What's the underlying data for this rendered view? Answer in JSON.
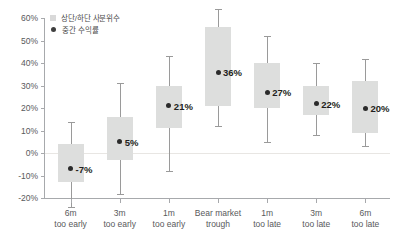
{
  "chart_data": {
    "type": "box",
    "title": "",
    "xlabel": "",
    "ylabel": "",
    "ylim": [
      -20,
      60
    ],
    "ytick_labels": [
      "60%",
      "50%",
      "40%",
      "30%",
      "20%",
      "10%",
      "0%",
      "-10%",
      "-20%"
    ],
    "ytick_values": [
      60,
      50,
      40,
      30,
      20,
      10,
      0,
      -10,
      -20
    ],
    "grid": false,
    "zero_line": true,
    "legend_position": "top-left",
    "legend": [
      {
        "key": "box",
        "label": "상단/하단 사분위수",
        "marker": "square",
        "color": "#d9d9d9"
      },
      {
        "key": "median",
        "label": "중간 수익률",
        "marker": "circle",
        "color": "#3f3f3f"
      }
    ],
    "categories": [
      "6m too early",
      "3m too early",
      "1m too early",
      "Bear market trough",
      "1m too late",
      "3m too late",
      "6m too late"
    ],
    "category_lines": [
      [
        "6m",
        "too early"
      ],
      [
        "3m",
        "too early"
      ],
      [
        "1m",
        "too early"
      ],
      [
        "Bear market",
        "trough"
      ],
      [
        "1m",
        "too late"
      ],
      [
        "3m",
        "too late"
      ],
      [
        "6m",
        "too late"
      ]
    ],
    "boxes": [
      {
        "category": "6m too early",
        "low": -24,
        "q1": -13,
        "median": -7,
        "q3": 4,
        "high": 14,
        "label": "-7%"
      },
      {
        "category": "3m too early",
        "low": -18,
        "q1": -3,
        "median": 5,
        "q3": 16,
        "high": 31,
        "label": "5%"
      },
      {
        "category": "1m too early",
        "low": -8,
        "q1": 11,
        "median": 21,
        "q3": 30,
        "high": 43,
        "label": "21%"
      },
      {
        "category": "Bear market trough",
        "low": 12,
        "q1": 21,
        "median": 36,
        "q3": 56,
        "high": 64,
        "label": "36%"
      },
      {
        "category": "1m too late",
        "low": 5,
        "q1": 20,
        "median": 27,
        "q3": 40,
        "high": 52,
        "label": "27%"
      },
      {
        "category": "3m too late",
        "low": 8,
        "q1": 17,
        "median": 22,
        "q3": 30,
        "high": 40,
        "label": "22%"
      },
      {
        "category": "6m too late",
        "low": 3,
        "q1": 9,
        "median": 20,
        "q3": 32,
        "high": 42,
        "label": "20%"
      }
    ],
    "colors": {
      "box_fill": "#dddedd",
      "median_dot": "#2b2b2b",
      "whisker": "#9a9a9a",
      "axis": "#a7a9ac",
      "zero_line": "#e8e6e3",
      "tick_text": "#58595b",
      "value_text": "#231f20"
    }
  }
}
